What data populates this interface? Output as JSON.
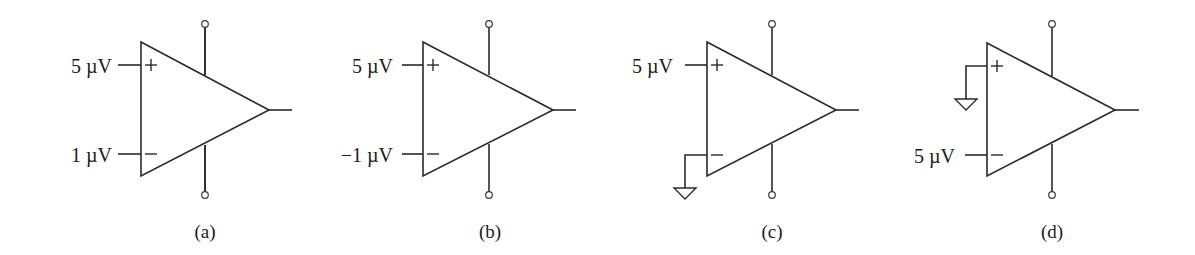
{
  "figure": {
    "stroke_color": "#2a2a2a",
    "background": "#ffffff",
    "panels": [
      {
        "id": "a",
        "caption": "(a)",
        "noninverting_input": {
          "type": "voltage",
          "label": "5 µV"
        },
        "inverting_input": {
          "type": "voltage",
          "label": "1 µV"
        },
        "plus_sign": "+",
        "minus_sign": "−"
      },
      {
        "id": "b",
        "caption": "(b)",
        "noninverting_input": {
          "type": "voltage",
          "label": "5 µV"
        },
        "inverting_input": {
          "type": "voltage",
          "label": "−1 µV"
        },
        "plus_sign": "+",
        "minus_sign": "−"
      },
      {
        "id": "c",
        "caption": "(c)",
        "noninverting_input": {
          "type": "voltage",
          "label": "5 µV"
        },
        "inverting_input": {
          "type": "ground",
          "label": ""
        },
        "plus_sign": "+",
        "minus_sign": "−"
      },
      {
        "id": "d",
        "caption": "(d)",
        "noninverting_input": {
          "type": "ground",
          "label": ""
        },
        "inverting_input": {
          "type": "voltage",
          "label": "5 µV"
        },
        "plus_sign": "+",
        "minus_sign": "−"
      }
    ]
  }
}
